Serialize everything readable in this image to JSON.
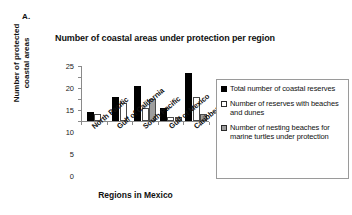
{
  "panel": {
    "label": "A."
  },
  "chart_data": {
    "type": "bar",
    "title": "Number of coastal areas under protection per region",
    "xlabel": "Regions in Mexico",
    "ylabel": "Number of protected\ncoastal areas",
    "categories": [
      "North Pacific",
      "Gulf of California",
      "South Pacific",
      "Gulf of Mexico",
      "Caribbean Sea"
    ],
    "series": [
      {
        "name": "Total number of coastal reserves",
        "color": "#000000",
        "values": [
          4,
          11,
          16,
          6,
          22
        ]
      },
      {
        "name": "Number of reserves with beaches and dunes",
        "color": "#ffffff",
        "values": [
          3,
          8,
          6,
          2,
          11
        ]
      },
      {
        "name": "Number of nesting beaches for marine turtles under protection",
        "color": "#9e9e9e",
        "values": [
          0,
          0,
          10,
          2,
          3
        ]
      }
    ],
    "ylim": [
      0,
      25
    ],
    "yticks": [
      0,
      5,
      10,
      15,
      20,
      25
    ],
    "grid": false,
    "legend_position": "right"
  },
  "legend": {
    "entries": [
      "Total number of coastal reserves",
      "Number of reserves with beaches and dunes",
      "Number of nesting beaches for marine turtles under protection"
    ]
  }
}
